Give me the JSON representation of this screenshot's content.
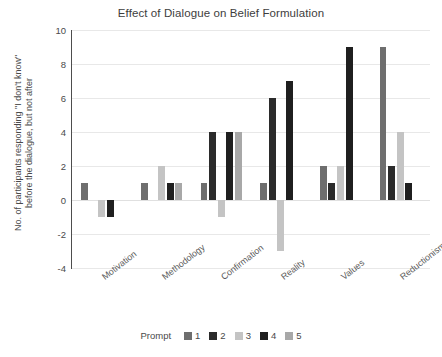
{
  "chart_data": {
    "type": "bar",
    "title": "Effect of Dialogue on Belief Formulation",
    "xlabel": "",
    "ylabel": "No. of participants responding \"I don't know\" before the dialogue, but not after",
    "categories": [
      "Motivation",
      "Methodology",
      "Confirmation",
      "Reality",
      "Values",
      "Reductionism"
    ],
    "ylim": [
      -4,
      10
    ],
    "yticks": [
      10,
      8,
      6,
      4,
      2,
      0,
      -2,
      -4
    ],
    "grid": true,
    "legend_title": "Prompt",
    "legend_position": "bottom",
    "series": [
      {
        "name": "1",
        "color": "#6e6e6e",
        "values": [
          1,
          1,
          1,
          1,
          2,
          9
        ]
      },
      {
        "name": "2",
        "color": "#2b2b2b",
        "values": [
          0,
          0,
          4,
          6,
          1,
          2
        ]
      },
      {
        "name": "3",
        "color": "#c4c4c4",
        "values": [
          -1,
          2,
          -1,
          -3,
          2,
          4
        ]
      },
      {
        "name": "4",
        "color": "#1f1f1f",
        "values": [
          -1,
          1,
          4,
          7,
          9,
          1
        ]
      },
      {
        "name": "5",
        "color": "#a8a8a8",
        "values": [
          0,
          1,
          4,
          0,
          0,
          0
        ]
      }
    ]
  },
  "legend": {
    "title": "Prompt",
    "items": [
      {
        "label": "1",
        "color": "#6e6e6e"
      },
      {
        "label": "2",
        "color": "#2b2b2b"
      },
      {
        "label": "3",
        "color": "#c4c4c4"
      },
      {
        "label": "4",
        "color": "#1f1f1f"
      },
      {
        "label": "5",
        "color": "#a8a8a8"
      }
    ]
  },
  "colors": {
    "background": "#ffffff",
    "grid": "#e8e8e8",
    "axis": "#4d4d4d",
    "text": "#4a4a4a",
    "title": "#3d3d3d"
  }
}
